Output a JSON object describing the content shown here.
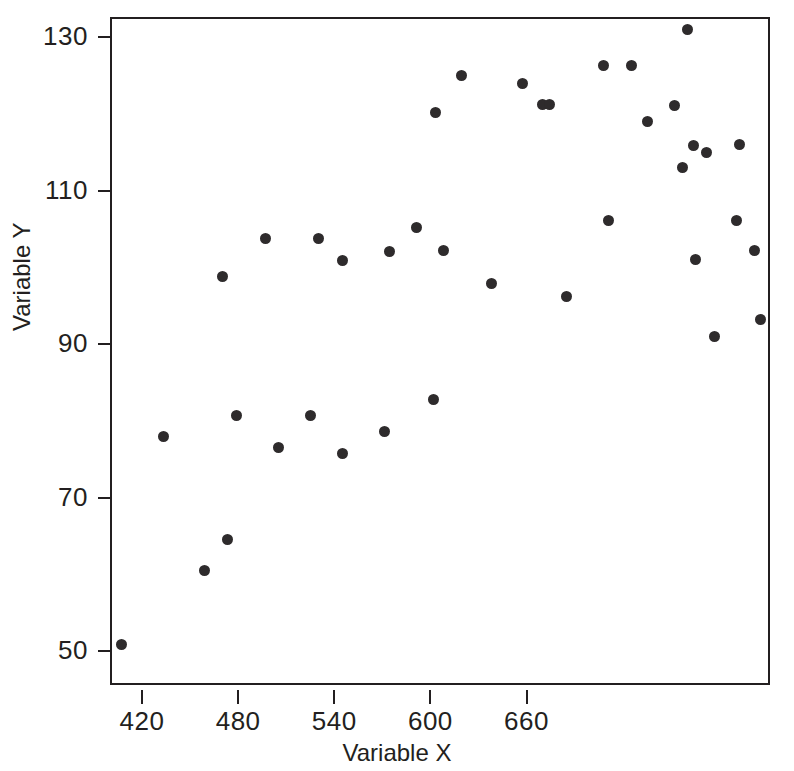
{
  "chart_data": {
    "type": "scatter",
    "title": "",
    "xlabel": "Variable X",
    "ylabel": "Variable Y",
    "xlim": [
      400,
      812
    ],
    "ylim": [
      45.6,
      132.6
    ],
    "xticks": [
      420,
      480,
      540,
      600,
      660
    ],
    "yticks": [
      50,
      70,
      90,
      110,
      130
    ],
    "xtick_labels": [
      "420",
      "480",
      "540",
      "600",
      "660"
    ],
    "ytick_labels": [
      "50",
      "70",
      "90",
      "110",
      "130"
    ],
    "grid": false,
    "legend": null,
    "marker": "filled-circle",
    "marker_color": "#2e2b2c",
    "frame_color": "#231f20",
    "background": "#ffffff",
    "n_points": 39,
    "x": [
      406,
      432,
      458,
      469,
      472,
      478,
      496,
      504,
      524,
      529,
      544,
      544,
      570,
      573,
      590,
      601,
      602,
      607,
      618,
      637,
      656,
      669,
      673,
      684,
      707,
      710,
      724,
      734,
      751,
      756,
      759,
      763,
      764,
      771,
      776,
      790,
      792,
      801,
      805
    ],
    "y": [
      51.2,
      78.2,
      60.8,
      99.1,
      64.8,
      81.0,
      104.0,
      76.8,
      81.0,
      104.0,
      101.1,
      76.0,
      78.9,
      102.3,
      105.4,
      83.0,
      120.4,
      102.5,
      125.2,
      98.2,
      124.2,
      121.4,
      121.4,
      96.4,
      126.5,
      106.4,
      126.5,
      119.3,
      121.3,
      113.2,
      131.2,
      116.1,
      101.3,
      115.2,
      91.2,
      106.3,
      116.2,
      102.5,
      93.4
    ],
    "points": [
      {
        "x": 406,
        "y": 51.2
      },
      {
        "x": 432,
        "y": 78.2
      },
      {
        "x": 458,
        "y": 60.8
      },
      {
        "x": 469,
        "y": 99.1
      },
      {
        "x": 472,
        "y": 64.8
      },
      {
        "x": 478,
        "y": 81.0
      },
      {
        "x": 496,
        "y": 104.0
      },
      {
        "x": 504,
        "y": 76.8
      },
      {
        "x": 524,
        "y": 81.0
      },
      {
        "x": 529,
        "y": 104.0
      },
      {
        "x": 544,
        "y": 101.1
      },
      {
        "x": 544,
        "y": 76.0
      },
      {
        "x": 570,
        "y": 78.9
      },
      {
        "x": 573,
        "y": 102.3
      },
      {
        "x": 590,
        "y": 105.4
      },
      {
        "x": 601,
        "y": 83.0
      },
      {
        "x": 602,
        "y": 120.4
      },
      {
        "x": 607,
        "y": 102.5
      },
      {
        "x": 618,
        "y": 125.2
      },
      {
        "x": 637,
        "y": 98.2
      },
      {
        "x": 656,
        "y": 124.2
      },
      {
        "x": 669,
        "y": 121.4
      },
      {
        "x": 673,
        "y": 121.4
      },
      {
        "x": 684,
        "y": 96.4
      },
      {
        "x": 707,
        "y": 126.5
      },
      {
        "x": 710,
        "y": 106.4
      },
      {
        "x": 724,
        "y": 126.5
      },
      {
        "x": 734,
        "y": 119.3
      },
      {
        "x": 751,
        "y": 121.3
      },
      {
        "x": 756,
        "y": 113.2
      },
      {
        "x": 759,
        "y": 131.2
      },
      {
        "x": 763,
        "y": 116.1
      },
      {
        "x": 764,
        "y": 101.3
      },
      {
        "x": 771,
        "y": 115.2
      },
      {
        "x": 776,
        "y": 91.2
      },
      {
        "x": 790,
        "y": 106.3
      },
      {
        "x": 792,
        "y": 116.2
      },
      {
        "x": 801,
        "y": 102.5
      },
      {
        "x": 805,
        "y": 93.4
      }
    ]
  }
}
